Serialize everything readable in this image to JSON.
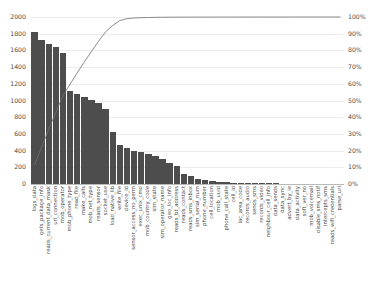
{
  "chart_data": {
    "type": "bar",
    "title": "",
    "subtitle": "",
    "xlabel": "",
    "ylabel": "",
    "ylim": [
      0,
      2000
    ],
    "y2lim": [
      0,
      100
    ],
    "grid": true,
    "legend": "none",
    "bar_color": "#4d4d4d",
    "line_color": "#6f6f6f",
    "categories": [
      "logs_data",
      "gets_package_info",
      "reads_current_data_mask",
      "url_connection",
      "mob_operator",
      "mob_phone_type",
      "read_file",
      "make_calls",
      "mob_net_type",
      "reads_sensor",
      "socket_use",
      "load_native_lib",
      "write_file",
      "device_id",
      "sensor_access_no_perm",
      "exec_unix_cmd",
      "mob_country_code",
      "sim_state",
      "sim_operator_name",
      "geo_loc_info",
      "reads_bt_address",
      "reads_contact",
      "reads_sms_inbox",
      "sim_serial_num",
      "phone_number",
      "cell_location",
      "mob_uuid",
      "phone_call_state",
      "cell_id",
      "lac_area_code",
      "records_audio",
      "sends_sms",
      "records_video",
      "neighbour_cell_info",
      "data_sends",
      "data_sync",
      "advert_by_ie",
      "data_activity",
      "soft_ver_no",
      "mob_voicemail",
      "disable_sms_notif",
      "intercepts_sms",
      "reads_wifi_credentials",
      "parse_uri"
    ],
    "values": [
      1820,
      1720,
      1680,
      1640,
      1570,
      1110,
      1080,
      1040,
      1010,
      970,
      900,
      620,
      470,
      430,
      400,
      380,
      360,
      340,
      300,
      250,
      220,
      120,
      95,
      60,
      45,
      35,
      28,
      22,
      18,
      15,
      13,
      11,
      9,
      8,
      7,
      6,
      5,
      5,
      4,
      4,
      3,
      3,
      2,
      2
    ],
    "cumulative_percent": [
      11.4,
      22.2,
      32.7,
      43.0,
      52.9,
      59.8,
      66.6,
      73.1,
      79.4,
      85.5,
      91.2,
      95.0,
      97.9,
      99.0,
      99.4,
      99.6,
      99.7,
      99.8,
      99.85,
      99.88,
      99.9,
      99.92,
      99.93,
      99.94,
      99.95,
      99.955,
      99.96,
      99.965,
      99.97,
      99.975,
      99.98,
      99.982,
      99.984,
      99.986,
      99.988,
      99.99,
      99.991,
      99.992,
      99.993,
      99.995,
      99.996,
      99.997,
      99.998,
      100.0
    ],
    "y_ticks": [
      "0",
      "200",
      "400",
      "600",
      "800",
      "1000",
      "1200",
      "1400",
      "1600",
      "1800",
      "2000"
    ],
    "y2_ticks": [
      "0%",
      "10%",
      "20%",
      "30%",
      "40%",
      "50%",
      "60%",
      "70%",
      "80%",
      "90%",
      "100%"
    ]
  }
}
